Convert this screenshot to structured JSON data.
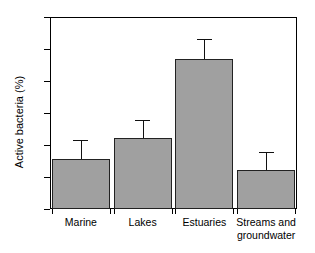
{
  "chart_data": {
    "type": "bar",
    "title": "",
    "xlabel": "",
    "ylabel": "Active bacteria (%)",
    "categories": [
      "Marine",
      "Lakes",
      "Estuaries",
      "Streams and\ngroundwater"
    ],
    "values": [
      15.5,
      22.2,
      47.0,
      12.2
    ],
    "errors": [
      6.0,
      5.5,
      6.0,
      5.5
    ],
    "ylim": [
      0,
      60
    ],
    "yticks": [
      0,
      10,
      20,
      30,
      40,
      50,
      60
    ],
    "ytick_labels": [
      "0",
      "10",
      "20",
      "30",
      "40",
      "50",
      "60"
    ],
    "grid": false,
    "legend": null,
    "bar_color": "#a0a0a0",
    "edge_color": "#222222",
    "error_color": "#111111"
  }
}
